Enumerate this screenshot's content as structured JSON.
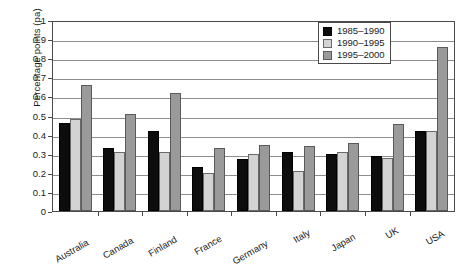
{
  "chart_data": {
    "type": "bar",
    "title": "",
    "subtitle": "",
    "xlabel": "",
    "ylabel": "Percentage points (pa)",
    "ylim": [
      0,
      1
    ],
    "ytick_step": 0.1,
    "yticks": [
      "1",
      "0.9",
      "0.8",
      "0.7",
      "0.6",
      "0.5",
      "0.4",
      "0.3",
      "0.2",
      "0.1",
      "0"
    ],
    "grid": true,
    "legend_position": "top-right",
    "categories": [
      "Australia",
      "Canada",
      "Finland",
      "France",
      "Germany",
      "Italy",
      "Japan",
      "UK",
      "USA"
    ],
    "series": [
      {
        "name": "1985–1990",
        "color": "#0d0d0d",
        "values": [
          0.46,
          0.33,
          0.42,
          0.23,
          0.27,
          0.31,
          0.3,
          0.29,
          0.42
        ]
      },
      {
        "name": "1990–1995",
        "color": "#d3d3d3",
        "values": [
          0.48,
          0.31,
          0.31,
          0.2,
          0.3,
          0.21,
          0.31,
          0.28,
          0.42
        ]
      },
      {
        "name": "1995–2000",
        "color": "#9a9a9a",
        "values": [
          0.66,
          0.51,
          0.62,
          0.33,
          0.345,
          0.34,
          0.355,
          0.455,
          0.86
        ]
      }
    ]
  }
}
